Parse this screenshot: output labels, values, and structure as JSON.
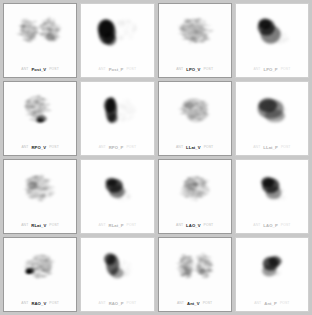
{
  "viewer": {
    "name": "lung-scintigraphy-grid",
    "background_color": "#c8c8c8",
    "panel_background": "#fdfdfd",
    "border_color": "#9a9a9a",
    "columns": 4,
    "rows": 4
  },
  "panels": [
    {
      "label": "Post_V",
      "side_left": "ANT",
      "side_right": "POST",
      "study": "ventilation",
      "tone": "dark",
      "pattern": "bilateral-lungs"
    },
    {
      "label": "Post_P",
      "side_left": "ANT",
      "side_right": "POST",
      "study": "perfusion",
      "tone": "light",
      "pattern": "dense-left-blob"
    },
    {
      "label": "LPO_V",
      "side_left": "ANT",
      "side_right": "POST",
      "study": "ventilation",
      "tone": "dark",
      "pattern": "single-lung-wedge"
    },
    {
      "label": "LPO_P",
      "side_left": "ANT",
      "side_right": "POST",
      "study": "perfusion",
      "tone": "light",
      "pattern": "dense-apex-wedge"
    },
    {
      "label": "RPO_V",
      "side_left": "ANT",
      "side_right": "POST",
      "study": "ventilation",
      "tone": "dark",
      "pattern": "lung-hot-base"
    },
    {
      "label": "RPO_P",
      "side_left": "ANT",
      "side_right": "POST",
      "study": "perfusion",
      "tone": "light",
      "pattern": "dense-vertical-band"
    },
    {
      "label": "LLat_V",
      "side_left": "ANT",
      "side_right": "POST",
      "study": "ventilation",
      "tone": "dark",
      "pattern": "lateral-dome"
    },
    {
      "label": "LLat_P",
      "side_left": "ANT",
      "side_right": "POST",
      "study": "perfusion",
      "tone": "light",
      "pattern": "broad-dome"
    },
    {
      "label": "RLat_V",
      "side_left": "ANT",
      "side_right": "POST",
      "study": "ventilation",
      "tone": "dark",
      "pattern": "diffuse-lateral"
    },
    {
      "label": "RLat_P",
      "side_left": "ANT",
      "side_right": "POST",
      "study": "perfusion",
      "tone": "light",
      "pattern": "dense-round-blob"
    },
    {
      "label": "LAO_V",
      "side_left": "ANT",
      "side_right": "POST",
      "study": "ventilation",
      "tone": "dark",
      "pattern": "oblique-lung"
    },
    {
      "label": "LAO_P",
      "side_left": "ANT",
      "side_right": "POST",
      "study": "perfusion",
      "tone": "light",
      "pattern": "dense-oblique-blob"
    },
    {
      "label": "RAO_V",
      "side_left": "ANT",
      "side_right": "POST",
      "study": "ventilation",
      "tone": "dark",
      "pattern": "hot-focus-left"
    },
    {
      "label": "RAO_P",
      "side_left": "ANT",
      "side_right": "POST",
      "study": "perfusion",
      "tone": "light",
      "pattern": "tapered-crescent"
    },
    {
      "label": "Ant_V",
      "side_left": "ANT",
      "side_right": "POST",
      "study": "ventilation",
      "tone": "dark",
      "pattern": "anterior-bilateral"
    },
    {
      "label": "Ant_P",
      "side_left": "ANT",
      "side_right": "POST",
      "study": "perfusion",
      "tone": "light",
      "pattern": "anterior-dense"
    }
  ]
}
